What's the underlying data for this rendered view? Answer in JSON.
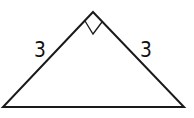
{
  "diagram": {
    "type": "right isosceles triangle",
    "left_leg_label": "3",
    "right_leg_label": "3",
    "right_angle_marker": "apex",
    "stroke_color": "#1a1a1a"
  }
}
